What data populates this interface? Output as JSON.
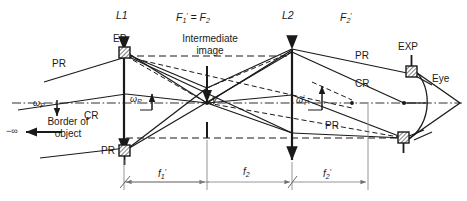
{
  "figure": {
    "type": "optical-ray-diagram",
    "background": "#ffffff",
    "ink": "#1a1a1a",
    "dimension_line_color": "#8a8a8a",
    "width": 467,
    "height": 201
  },
  "labels": {
    "lens1": "L1",
    "lens2": "L2",
    "focal_common": "F′1 = F2",
    "focal_common_parts": {
      "f1p": "F",
      "f1p_sub": "1",
      "eq": " = ",
      "f2": "F",
      "f2_sub": "2"
    },
    "focal2_prime": "F′2",
    "entrance_pupil": "EP",
    "exit_pupil": "EXP",
    "eye": "Eye",
    "intermediate_image_line1": "Intermediate",
    "intermediate_image_line2": "image",
    "border_of_object_line1": "Border of",
    "border_of_object_line2": "object",
    "infinity": "−∞",
    "principal_ray_1": "PR",
    "principal_ray_2": "PR",
    "principal_ray_3": "PR",
    "principal_ray_4": "PR",
    "chief_ray_1": "CR",
    "chief_ray_2": "CR",
    "omega_p_left": "ωP",
    "omega_p_mid": "ωP",
    "omega_p_right": "ω′P",
    "image_height": "y′",
    "dim_f1_prime": "f′1",
    "dim_f2": "f2",
    "dim_f2_prime": "f′2"
  },
  "geometry": {
    "optical_axis_y": 103,
    "lens1_x": 124,
    "lens2_x": 292,
    "focal_common_x": 207,
    "focal2_prime_x": 345,
    "exit_pupil_x": 411,
    "lens1_top_y": 48,
    "lens1_bottom_y": 152,
    "lens2_top_y": 49,
    "lens2_bottom_y": 160,
    "dimension_baseline_y": 182,
    "segments": [
      {
        "name": "f1-prime",
        "from_x": 124,
        "to_x": 207,
        "label": "f′1"
      },
      {
        "name": "f2",
        "from_x": 207,
        "to_x": 292,
        "label": "f2"
      },
      {
        "name": "f2-prime",
        "from_x": 292,
        "to_x": 368,
        "label": "f′2"
      }
    ]
  },
  "elements": {
    "stops": [
      {
        "name": "entrance-pupil-top",
        "x": 124,
        "y": 52,
        "hatched": true
      },
      {
        "name": "entrance-pupil-bottom",
        "x": 124,
        "y": 150,
        "hatched": true
      },
      {
        "name": "exit-pupil-top",
        "x": 411,
        "y": 70,
        "hatched": true
      },
      {
        "name": "exit-pupil-bottom",
        "x": 404,
        "y": 138,
        "hatched": true
      }
    ]
  }
}
